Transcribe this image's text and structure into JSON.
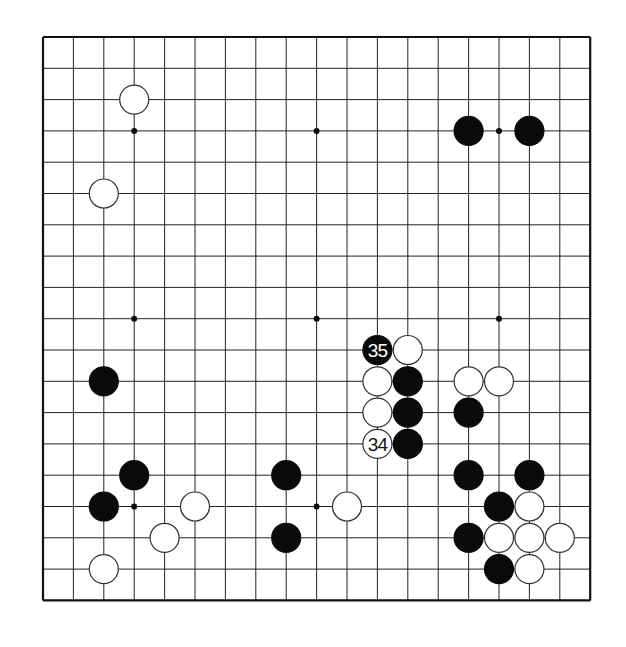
{
  "board": {
    "size": 19,
    "origin_x": 43,
    "origin_y": 37,
    "spacing_x": 30.4,
    "spacing_y": 31.3,
    "stone_radius": 14.5,
    "line_color": "#222222",
    "border_color": "#111111",
    "black_color": "#0a0a0a",
    "white_fill": "#ffffff",
    "white_stroke": "#333333",
    "star_points": [
      [
        3,
        3
      ],
      [
        9,
        3
      ],
      [
        15,
        3
      ],
      [
        3,
        9
      ],
      [
        9,
        9
      ],
      [
        15,
        9
      ],
      [
        3,
        15
      ],
      [
        9,
        15
      ],
      [
        15,
        15
      ]
    ]
  },
  "stones": [
    {
      "color": "white",
      "col": 3,
      "row": 2
    },
    {
      "color": "white",
      "col": 2,
      "row": 5
    },
    {
      "color": "black",
      "col": 14,
      "row": 3
    },
    {
      "color": "black",
      "col": 16,
      "row": 3
    },
    {
      "color": "black",
      "col": 11,
      "row": 10,
      "label": "35"
    },
    {
      "color": "white",
      "col": 12,
      "row": 10
    },
    {
      "color": "white",
      "col": 11,
      "row": 11
    },
    {
      "color": "black",
      "col": 12,
      "row": 11
    },
    {
      "color": "white",
      "col": 14,
      "row": 11
    },
    {
      "color": "white",
      "col": 15,
      "row": 11
    },
    {
      "color": "white",
      "col": 11,
      "row": 12
    },
    {
      "color": "black",
      "col": 12,
      "row": 12
    },
    {
      "color": "black",
      "col": 14,
      "row": 12
    },
    {
      "color": "white",
      "col": 11,
      "row": 13,
      "label": "34"
    },
    {
      "color": "black",
      "col": 12,
      "row": 13
    },
    {
      "color": "black",
      "col": 2,
      "row": 11
    },
    {
      "color": "black",
      "col": 3,
      "row": 14
    },
    {
      "color": "black",
      "col": 2,
      "row": 15
    },
    {
      "color": "white",
      "col": 5,
      "row": 15
    },
    {
      "color": "white",
      "col": 4,
      "row": 16
    },
    {
      "color": "white",
      "col": 2,
      "row": 17
    },
    {
      "color": "black",
      "col": 8,
      "row": 14
    },
    {
      "color": "white",
      "col": 10,
      "row": 15
    },
    {
      "color": "black",
      "col": 8,
      "row": 16
    },
    {
      "color": "black",
      "col": 14,
      "row": 14
    },
    {
      "color": "black",
      "col": 16,
      "row": 14
    },
    {
      "color": "black",
      "col": 15,
      "row": 15
    },
    {
      "color": "white",
      "col": 16,
      "row": 15
    },
    {
      "color": "black",
      "col": 14,
      "row": 16
    },
    {
      "color": "white",
      "col": 15,
      "row": 16
    },
    {
      "color": "white",
      "col": 16,
      "row": 16
    },
    {
      "color": "white",
      "col": 17,
      "row": 16
    },
    {
      "color": "black",
      "col": 15,
      "row": 17
    },
    {
      "color": "white",
      "col": 16,
      "row": 17
    }
  ],
  "move_labels": {
    "black_last": "35",
    "white_last": "34"
  }
}
